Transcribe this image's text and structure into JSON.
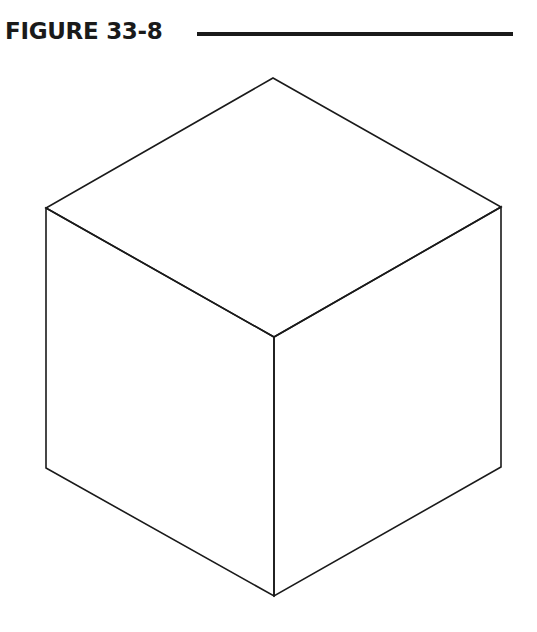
{
  "figure": {
    "title": "FIGURE 33-8"
  },
  "diagram": {
    "type": "isometric-cube-outline",
    "stroke_color": "#1a1a1a",
    "stroke_width": 1.6,
    "vertices": {
      "top": [
        273,
        78
      ],
      "left_top": [
        46,
        208
      ],
      "right_top": [
        501,
        207
      ],
      "center": [
        274,
        337
      ],
      "left_bottom": [
        46,
        468
      ],
      "right_bottom": [
        501,
        467
      ],
      "bottom": [
        274,
        596
      ]
    }
  }
}
